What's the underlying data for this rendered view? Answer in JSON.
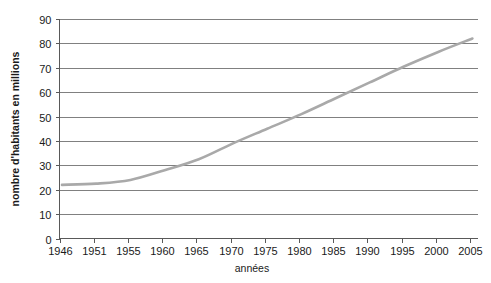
{
  "chart_data": {
    "type": "line",
    "title": "",
    "xlabel": "années",
    "ylabel": "nombre d'habitants en millions",
    "xlim": [
      1946,
      2008
    ],
    "ylim": [
      0,
      90
    ],
    "grid": true,
    "legend": false,
    "legend_position": "none",
    "line_color": "#a9a9a9",
    "x_tick_labels": [
      "1946",
      "1951",
      "1955",
      "1960",
      "1965",
      "1970",
      "1975",
      "1980",
      "1985",
      "1990",
      "1995",
      "2000",
      "2005"
    ],
    "y_tick_labels": [
      "0",
      "10",
      "20",
      "30",
      "40",
      "50",
      "60",
      "70",
      "80",
      "90"
    ],
    "y_ticks": [
      0,
      10,
      20,
      30,
      40,
      50,
      60,
      70,
      80,
      90
    ],
    "series": [
      {
        "name": "nombre d'habitants",
        "x": [
          1946,
          1951,
          1955,
          1960,
          1965,
          1970,
          1975,
          1980,
          1985,
          1990,
          1995,
          2000,
          2005
        ],
        "values": [
          22,
          22.5,
          24,
          28,
          32.5,
          39,
          45,
          51,
          57.5,
          64,
          70.5,
          76.5,
          82
        ]
      }
    ]
  },
  "axes": {
    "y_title": "nombre d'habitants en millions",
    "x_title": "années"
  }
}
